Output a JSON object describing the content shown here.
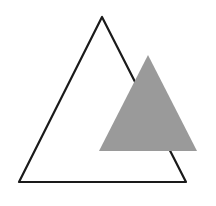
{
  "canvas": {
    "width": 216,
    "height": 206,
    "background": "#ffffff"
  },
  "shapes": {
    "outline_triangle": {
      "points": "102,17 19,182 186,182",
      "stroke": "#1a1a1a",
      "stroke_width": 2.2,
      "fill": "none"
    },
    "filled_triangle": {
      "points": "148,55 99,151 197,151",
      "fill": "#9a9a9a",
      "stroke": "none"
    }
  }
}
